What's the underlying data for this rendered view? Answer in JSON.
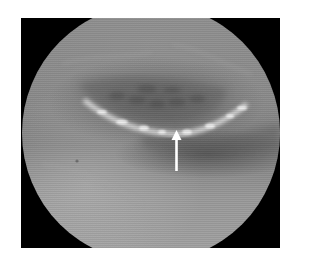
{
  "image": {
    "type": "endoscopic-view",
    "description": "Circular endoscopic field of view on black square background showing a curved bright lesion margin with a white arrow pointing upward at it",
    "colors": {
      "page_background": "#ffffff",
      "frame_background": "#000000",
      "tissue_base": "#8a8a8a",
      "lesion_highlight": "#e6e6e6",
      "arrow": "#ffffff"
    },
    "annotation": {
      "kind": "arrow",
      "direction": "up",
      "target": "lesion-margin"
    }
  }
}
